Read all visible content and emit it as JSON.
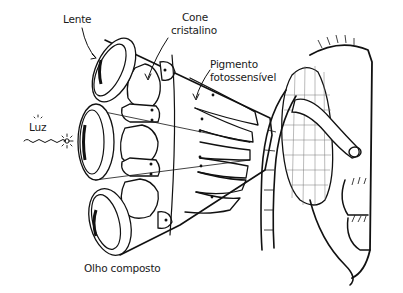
{
  "diagram": {
    "labels": {
      "lente": "Lente",
      "cone_line1": "Cone",
      "cone_line2": "cristalino",
      "pigmento_line1": "Pigmento",
      "pigmento_line2": "fotossensível",
      "luz": "Luz",
      "olho_composto": "Olho composto"
    },
    "icons": {
      "light_source": "sun-sparkle-icon",
      "light_wave": "wavy-line"
    },
    "colors": {
      "ink": "#111111",
      "background": "#ffffff",
      "mesh": "#777777"
    }
  }
}
